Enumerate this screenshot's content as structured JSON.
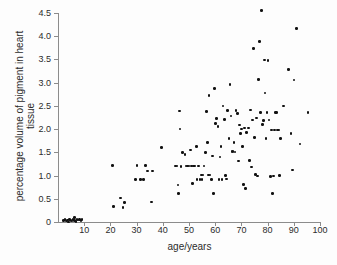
{
  "chart_data": {
    "type": "scatter",
    "title": "",
    "xlabel": "age/years",
    "ylabel": "percentage volume of pigment in heart tissue",
    "xlim": [
      0,
      100
    ],
    "ylim": [
      0,
      4.5
    ],
    "xticks": [
      10,
      20,
      30,
      40,
      50,
      60,
      70,
      80,
      90,
      100
    ],
    "xticklabels": [
      "10",
      "20",
      "30",
      "40",
      "50",
      "60",
      "70",
      "80",
      "90",
      "100"
    ],
    "yticks": [
      0,
      0.5,
      1.0,
      1.5,
      2.0,
      2.5,
      3.0,
      3.5,
      4.0,
      4.5
    ],
    "yticklabels": [
      "0",
      "0.5",
      "1.0",
      "1.5",
      "2.0",
      "2.5",
      "3.0",
      "3.5",
      "4.0",
      "4.5"
    ],
    "grid": false,
    "legend": null,
    "marker": {
      "shape": "circle",
      "color": "#111111",
      "size": 2.6
    },
    "series": [
      {
        "name": "heart tissue pigment",
        "points": [
          [
            2.0,
            0.03
          ],
          [
            2.6,
            0.05
          ],
          [
            3.2,
            0.02
          ],
          [
            3.6,
            0.04
          ],
          [
            4.0,
            0.0
          ],
          [
            4.4,
            0.06
          ],
          [
            5.0,
            0.03
          ],
          [
            5.4,
            0.02
          ],
          [
            5.8,
            0.05
          ],
          [
            6.2,
            0.1
          ],
          [
            6.4,
            0.03
          ],
          [
            6.8,
            0.01
          ],
          [
            7.2,
            0.05
          ],
          [
            7.6,
            0.04
          ],
          [
            8.2,
            0.06
          ],
          [
            8.8,
            0.03
          ],
          [
            9.2,
            0.05
          ],
          [
            20.8,
            1.22
          ],
          [
            21.2,
            0.33
          ],
          [
            23.8,
            0.52
          ],
          [
            24.8,
            0.31
          ],
          [
            25.4,
            0.42
          ],
          [
            29.6,
            0.91
          ],
          [
            30.2,
            1.22
          ],
          [
            31.4,
            0.91
          ],
          [
            32.6,
            0.91
          ],
          [
            33.4,
            1.22
          ],
          [
            34.2,
            1.1
          ],
          [
            35.6,
            0.43
          ],
          [
            36.0,
            1.1
          ],
          [
            39.4,
            1.61
          ],
          [
            44.8,
            1.21
          ],
          [
            45.4,
            1.21
          ],
          [
            45.8,
            0.8
          ],
          [
            46.0,
            0.61
          ],
          [
            46.4,
            2.39
          ],
          [
            46.6,
            2.0
          ],
          [
            47.0,
            1.2
          ],
          [
            47.6,
            1.5
          ],
          [
            48.4,
            1.45
          ],
          [
            48.8,
            1.21
          ],
          [
            49.4,
            1.21
          ],
          [
            50.0,
            1.21
          ],
          [
            50.6,
            1.55
          ],
          [
            51.0,
            1.21
          ],
          [
            51.4,
            0.83
          ],
          [
            51.8,
            1.21
          ],
          [
            52.2,
            1.21
          ],
          [
            52.8,
            1.62
          ],
          [
            53.0,
            0.91
          ],
          [
            53.6,
            1.21
          ],
          [
            54.2,
            0.91
          ],
          [
            54.8,
            1.01
          ],
          [
            55.0,
            0.91
          ],
          [
            55.4,
            1.01
          ],
          [
            55.8,
            1.21
          ],
          [
            56.2,
            1.5
          ],
          [
            56.6,
            2.38
          ],
          [
            57.0,
            1.71
          ],
          [
            57.4,
            1.01
          ],
          [
            57.6,
            2.72
          ],
          [
            58.0,
            1.01
          ],
          [
            58.6,
            0.91
          ],
          [
            59.0,
            1.42
          ],
          [
            59.4,
            0.62
          ],
          [
            59.8,
            2.88
          ],
          [
            60.2,
            2.12
          ],
          [
            60.6,
            2.23
          ],
          [
            61.0,
            2.05
          ],
          [
            61.4,
            0.91
          ],
          [
            61.8,
            1.4
          ],
          [
            62.2,
            1.62
          ],
          [
            62.6,
            0.91
          ],
          [
            63.0,
            2.5
          ],
          [
            63.6,
            2.21
          ],
          [
            64.0,
            1.0
          ],
          [
            64.4,
            0.93
          ],
          [
            64.8,
            2.4
          ],
          [
            65.2,
            1.8
          ],
          [
            65.6,
            2.96
          ],
          [
            66.0,
            2.28
          ],
          [
            66.4,
            1.52
          ],
          [
            66.8,
            1.52
          ],
          [
            67.2,
            1.71
          ],
          [
            67.6,
            1.51
          ],
          [
            68.0,
            2.4
          ],
          [
            68.4,
            2.34
          ],
          [
            68.8,
            1.31
          ],
          [
            69.2,
            2.09
          ],
          [
            69.6,
            1.9
          ],
          [
            70.0,
            2.0
          ],
          [
            70.4,
            1.62
          ],
          [
            70.8,
            0.81
          ],
          [
            71.2,
            2.02
          ],
          [
            71.6,
            0.72
          ],
          [
            72.0,
            1.93
          ],
          [
            72.6,
            2.02
          ],
          [
            73.0,
            1.32
          ],
          [
            73.4,
            2.41
          ],
          [
            73.8,
            1.18
          ],
          [
            74.2,
            2.2
          ],
          [
            74.6,
            3.74
          ],
          [
            75.0,
            1.82
          ],
          [
            75.4,
            1.02
          ],
          [
            75.8,
            2.24
          ],
          [
            76.2,
            0.99
          ],
          [
            76.6,
            3.07
          ],
          [
            77.0,
            3.88
          ],
          [
            77.4,
            2.36
          ],
          [
            77.6,
            4.56
          ],
          [
            78.0,
            2.1
          ],
          [
            78.4,
            2.18
          ],
          [
            78.8,
            3.49
          ],
          [
            79.0,
            2.78
          ],
          [
            79.4,
            1.8
          ],
          [
            79.8,
            2.36
          ],
          [
            80.2,
            3.48
          ],
          [
            80.6,
            2.2
          ],
          [
            81.0,
            0.98
          ],
          [
            81.4,
            1.98
          ],
          [
            81.8,
            0.62
          ],
          [
            82.2,
            0.99
          ],
          [
            82.6,
            1.98
          ],
          [
            83.0,
            2.36
          ],
          [
            83.4,
            2.36
          ],
          [
            83.8,
            1.98
          ],
          [
            84.2,
            1.98
          ],
          [
            84.6,
            1.0
          ],
          [
            85.0,
            1.8
          ],
          [
            86.0,
            2.5
          ],
          [
            88.0,
            3.28
          ],
          [
            89.0,
            1.9
          ],
          [
            89.4,
            1.12
          ],
          [
            90.0,
            3.06
          ],
          [
            91.0,
            4.17
          ],
          [
            92.4,
            1.68
          ],
          [
            95.4,
            2.36
          ]
        ]
      }
    ]
  }
}
